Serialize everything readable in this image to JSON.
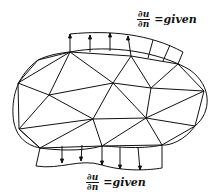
{
  "labels": {
    "top": {
      "numerator": "∂u",
      "denominator": "∂n",
      "rhs": "=given"
    },
    "bottom": {
      "numerator": "∂u",
      "denominator": "∂n",
      "rhs": "=given"
    }
  },
  "colors": {
    "stroke": "#111111",
    "background": "#ffffff"
  },
  "mesh": {
    "nodes": {
      "A": [
        70,
        52
      ],
      "N1": [
        38,
        60
      ],
      "B": [
        18,
        83
      ],
      "C": [
        49,
        95
      ],
      "D": [
        113,
        83
      ],
      "E": [
        151,
        88
      ],
      "M": [
        178,
        64
      ],
      "F": [
        204,
        91
      ],
      "G": [
        93,
        119
      ],
      "H": [
        146,
        118
      ],
      "I": [
        19,
        129
      ],
      "J": [
        102,
        146
      ],
      "K": [
        195,
        126
      ],
      "L": [
        162,
        145
      ],
      "P": [
        40,
        148
      ],
      "T": [
        131,
        56
      ]
    },
    "description": "Unstructured triangular finite-element mesh inside an oval domain with Neumann boundary flux arrows on top and bottom segments"
  }
}
